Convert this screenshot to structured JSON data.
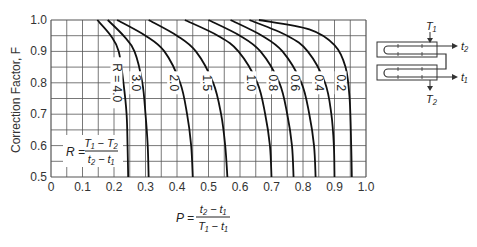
{
  "chart_data": {
    "type": "line",
    "title": "",
    "xlabel": "P = (t2 - t1) / (T1 - t1)",
    "ylabel": "Correction Factor, F",
    "xlim": [
      0,
      1.0
    ],
    "ylim": [
      0.5,
      1.0
    ],
    "grid": true,
    "grid_minor_step": {
      "x": 0.05,
      "y": 0.05
    },
    "x_ticks": [
      "0",
      "0.1",
      "0.2",
      "0.3",
      "0.4",
      "0.5",
      "0.6",
      "0.7",
      "0.8",
      "0.9",
      "1.0"
    ],
    "y_ticks": [
      "0.5",
      "0.6",
      "0.7",
      "0.8",
      "0.9",
      "1.0"
    ],
    "legend_position": "inline curve labels",
    "annotations": [
      "R = (T1 - T2) / (t2 - t1)",
      "P = (t2 - t1) / (T1 - t1)",
      "Schematic: shell-and-tube exchanger, T1 in / T2 out (shell), t1 in / t2 out (tubes)"
    ],
    "series": [
      {
        "name": "R = 4.0",
        "label": "R = 4.0",
        "points": [
          [
            0.147,
            1.0
          ],
          [
            0.19,
            0.95
          ],
          [
            0.215,
            0.9
          ],
          [
            0.23,
            0.8
          ],
          [
            0.24,
            0.7
          ],
          [
            0.243,
            0.6
          ],
          [
            0.245,
            0.5
          ]
        ]
      },
      {
        "name": "R = 3.0",
        "label": "3.0",
        "points": [
          [
            0.18,
            1.0
          ],
          [
            0.23,
            0.95
          ],
          [
            0.265,
            0.9
          ],
          [
            0.29,
            0.8
          ],
          [
            0.3,
            0.7
          ],
          [
            0.307,
            0.6
          ],
          [
            0.31,
            0.5
          ]
        ]
      },
      {
        "name": "R = 2.0",
        "label": "2.0",
        "points": [
          [
            0.21,
            1.0
          ],
          [
            0.3,
            0.95
          ],
          [
            0.36,
            0.9
          ],
          [
            0.41,
            0.8
          ],
          [
            0.432,
            0.7
          ],
          [
            0.445,
            0.6
          ],
          [
            0.45,
            0.5
          ]
        ]
      },
      {
        "name": "R = 1.5",
        "label": "1.5",
        "points": [
          [
            0.31,
            1.0
          ],
          [
            0.4,
            0.95
          ],
          [
            0.46,
            0.9
          ],
          [
            0.515,
            0.8
          ],
          [
            0.54,
            0.7
          ],
          [
            0.553,
            0.6
          ],
          [
            0.56,
            0.5
          ]
        ]
      },
      {
        "name": "R = 1.0",
        "label": "1.0",
        "points": [
          [
            0.425,
            1.0
          ],
          [
            0.53,
            0.95
          ],
          [
            0.595,
            0.9
          ],
          [
            0.655,
            0.8
          ],
          [
            0.68,
            0.7
          ],
          [
            0.695,
            0.6
          ],
          [
            0.7,
            0.5
          ]
        ]
      },
      {
        "name": "R = 0.8",
        "label": "0.8",
        "points": [
          [
            0.5,
            1.0
          ],
          [
            0.6,
            0.95
          ],
          [
            0.665,
            0.9
          ],
          [
            0.725,
            0.8
          ],
          [
            0.75,
            0.7
          ],
          [
            0.765,
            0.6
          ],
          [
            0.77,
            0.5
          ]
        ]
      },
      {
        "name": "R = 0.6",
        "label": "0.6",
        "points": [
          [
            0.57,
            1.0
          ],
          [
            0.67,
            0.95
          ],
          [
            0.735,
            0.9
          ],
          [
            0.795,
            0.8
          ],
          [
            0.82,
            0.7
          ],
          [
            0.835,
            0.6
          ],
          [
            0.84,
            0.5
          ]
        ]
      },
      {
        "name": "R = 0.4",
        "label": "0.4",
        "points": [
          [
            0.63,
            1.0
          ],
          [
            0.75,
            0.95
          ],
          [
            0.815,
            0.9
          ],
          [
            0.87,
            0.8
          ],
          [
            0.89,
            0.7
          ],
          [
            0.898,
            0.6
          ],
          [
            0.9,
            0.5
          ]
        ]
      },
      {
        "name": "R = 0.2",
        "label": "0.2",
        "points": [
          [
            0.66,
            1.0
          ],
          [
            0.82,
            0.97
          ],
          [
            0.9,
            0.92
          ],
          [
            0.935,
            0.85
          ],
          [
            0.948,
            0.75
          ],
          [
            0.953,
            0.6
          ],
          [
            0.955,
            0.5
          ]
        ]
      }
    ]
  },
  "labels": {
    "y_axis": "Correction Factor, F",
    "r_formula": {
      "lhs": "R =",
      "num": "T₁ − T₂",
      "den": "t₂ − t₁"
    },
    "p_formula": {
      "lhs": "P =",
      "num": "t₂ − t₁",
      "den": "T₁ − t₁"
    },
    "schematic": {
      "T1": "T₁",
      "T2": "T₂",
      "t1": "t₁",
      "t2": "t₂"
    }
  },
  "colors": {
    "grid": "#555555",
    "curve": "#111111",
    "axis": "#222222"
  }
}
